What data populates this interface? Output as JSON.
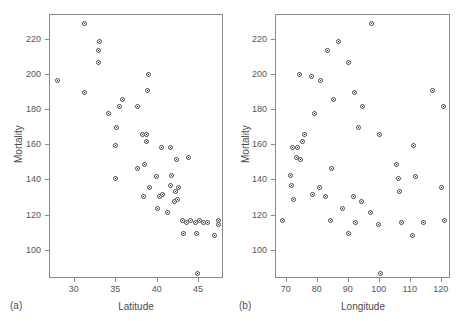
{
  "figure": {
    "background": "#ffffff",
    "marker_color": "#4a4a4a",
    "axis_color": "#8a8a8a"
  },
  "panel_a": {
    "tag": "(a)",
    "xlabel": "Latitude",
    "ylabel": "Mortality",
    "xticks": [
      "30",
      "35",
      "40",
      "45"
    ],
    "yticks": [
      "100",
      "120",
      "140",
      "160",
      "180",
      "200",
      "220"
    ]
  },
  "panel_b": {
    "tag": "(b)",
    "xlabel": "Longitude",
    "ylabel": "Mortality",
    "xticks": [
      "70",
      "80",
      "90",
      "100",
      "110",
      "120"
    ],
    "yticks": [
      "100",
      "120",
      "140",
      "160",
      "180",
      "200",
      "220"
    ]
  },
  "chart_data": [
    {
      "type": "scatter",
      "panel": "(a)",
      "title": "",
      "xlabel": "Latitude",
      "ylabel": "Mortality",
      "xlim": [
        27.0,
        48.0
      ],
      "ylim": [
        84.0,
        234.0
      ],
      "xticks": [
        30,
        35,
        40,
        45
      ],
      "yticks": [
        100,
        120,
        140,
        160,
        180,
        200,
        220
      ],
      "grid": false,
      "legend": null,
      "x": [
        27.9,
        31.2,
        31.2,
        32.8,
        32.8,
        33.0,
        34.0,
        34.9,
        34.9,
        35.0,
        35.4,
        35.8,
        37.5,
        37.5,
        38.2,
        38.3,
        38.4,
        38.7,
        38.7,
        38.8,
        38.9,
        39.0,
        39.8,
        40.0,
        40.2,
        40.5,
        40.6,
        41.2,
        41.5,
        41.6,
        41.7,
        42.0,
        42.2,
        42.3,
        42.4,
        42.5,
        43.0,
        43.1,
        43.5,
        43.7,
        44.0,
        44.5,
        44.7,
        44.8,
        45.0,
        45.5,
        46.0,
        46.8,
        47.3,
        47.3
      ],
      "y": [
        197.0,
        190.0,
        229.0,
        207.0,
        214.0,
        219.0,
        178.0,
        160.0,
        141.0,
        170.0,
        182.0,
        186.0,
        147.0,
        182.0,
        166.0,
        131.0,
        149.0,
        166.0,
        162.0,
        191.0,
        200.0,
        136.0,
        142.0,
        124.0,
        131.0,
        159.0,
        132.0,
        122.0,
        159.0,
        137.0,
        143.0,
        128.0,
        134.0,
        152.0,
        129.0,
        136.0,
        117.0,
        110.0,
        116.0,
        153.0,
        117.0,
        116.0,
        110.0,
        87.0,
        117.0,
        116.0,
        116.0,
        109.0,
        115.0,
        117.0
      ]
    },
    {
      "type": "scatter",
      "panel": "(b)",
      "title": "",
      "xlabel": "Longitude",
      "ylabel": "Mortality",
      "xlim": [
        66.5,
        123.0
      ],
      "ylim": [
        84.0,
        234.0
      ],
      "xticks": [
        70,
        80,
        90,
        100,
        110,
        120
      ],
      "yticks": [
        100,
        120,
        140,
        160,
        180,
        200,
        220
      ],
      "grid": false,
      "legend": null,
      "x": [
        68.5,
        71.3,
        71.5,
        71.8,
        72.0,
        73.0,
        73.5,
        74.0,
        74.5,
        75.2,
        75.8,
        78.0,
        78.3,
        79.0,
        80.5,
        81.0,
        82.5,
        83.0,
        84.0,
        84.5,
        85.0,
        86.8,
        88.0,
        89.8,
        90.0,
        91.5,
        92.0,
        92.3,
        93.0,
        94.0,
        94.5,
        97.0,
        97.3,
        99.5,
        100.0,
        100.3,
        105.5,
        106.0,
        106.5,
        107.0,
        110.5,
        111.0,
        111.5,
        114.0,
        117.0,
        119.8,
        120.5,
        121.0
      ],
      "y": [
        117.0,
        143.0,
        137.0,
        159.0,
        129.0,
        153.0,
        159.0,
        200.0,
        152.0,
        162.0,
        166.0,
        199.0,
        132.0,
        178.0,
        136.0,
        197.0,
        131.0,
        214.0,
        117.0,
        147.0,
        186.0,
        219.0,
        124.0,
        110.0,
        207.0,
        131.0,
        190.0,
        116.0,
        170.0,
        128.0,
        182.0,
        122.0,
        229.0,
        115.0,
        166.0,
        87.0,
        149.0,
        141.0,
        134.0,
        116.0,
        109.0,
        160.0,
        142.0,
        116.0,
        191.0,
        136.0,
        182.0,
        117.0
      ]
    }
  ]
}
